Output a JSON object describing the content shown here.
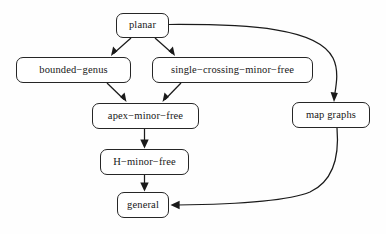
{
  "diagram": {
    "type": "directed-acyclic-graph",
    "title": "",
    "background_color": "#fefefe",
    "node_border_color": "#262626",
    "edge_color": "#1a1a1a",
    "text_color": "#171717",
    "nodes": [
      {
        "id": "planar",
        "label": "planar",
        "x": 116,
        "y": 13,
        "w": 53,
        "h": 25
      },
      {
        "id": "bounded_genus",
        "label": "bounded−genus",
        "x": 16,
        "y": 57,
        "w": 115,
        "h": 26
      },
      {
        "id": "single_crossing_minor_free",
        "label": "single−crossing−minor−free",
        "x": 152,
        "y": 57,
        "w": 161,
        "h": 26
      },
      {
        "id": "apex_minor_free",
        "label": "apex−minor−free",
        "x": 92,
        "y": 103,
        "w": 107,
        "h": 26
      },
      {
        "id": "h_minor_free",
        "label": "H−minor−free",
        "x": 100,
        "y": 149,
        "w": 89,
        "h": 26
      },
      {
        "id": "general",
        "label": "general",
        "x": 117,
        "y": 192,
        "w": 52,
        "h": 26
      },
      {
        "id": "map_graphs",
        "label": "map graphs",
        "x": 292,
        "y": 102,
        "w": 78,
        "h": 26
      }
    ],
    "edges": [
      {
        "from": "planar",
        "to": "bounded_genus",
        "style": "straight"
      },
      {
        "from": "planar",
        "to": "single_crossing_minor_free",
        "style": "straight"
      },
      {
        "from": "planar",
        "to": "map_graphs",
        "style": "curved"
      },
      {
        "from": "bounded_genus",
        "to": "apex_minor_free",
        "style": "straight"
      },
      {
        "from": "single_crossing_minor_free",
        "to": "apex_minor_free",
        "style": "straight"
      },
      {
        "from": "apex_minor_free",
        "to": "h_minor_free",
        "style": "straight"
      },
      {
        "from": "h_minor_free",
        "to": "general",
        "style": "straight"
      },
      {
        "from": "map_graphs",
        "to": "general",
        "style": "curved"
      }
    ]
  }
}
